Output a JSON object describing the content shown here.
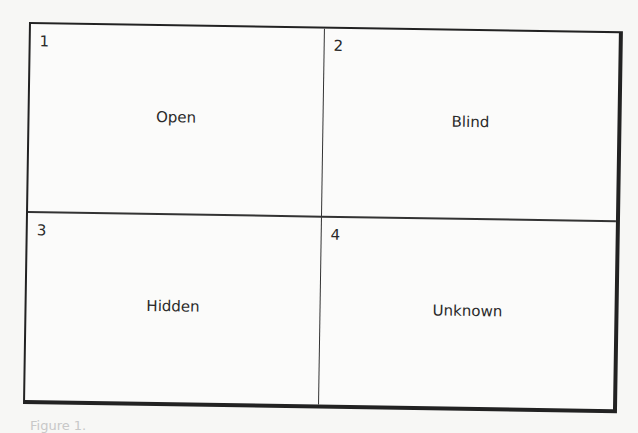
{
  "diagram": {
    "type": "2x2 grid (Johari window)",
    "quadrants": [
      {
        "number": "1",
        "label": "Open"
      },
      {
        "number": "2",
        "label": "Blind"
      },
      {
        "number": "3",
        "label": "Hidden"
      },
      {
        "number": "4",
        "label": "Unknown"
      }
    ]
  },
  "caption": "Figure 1."
}
